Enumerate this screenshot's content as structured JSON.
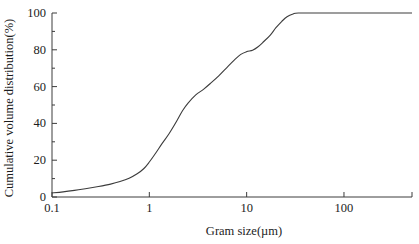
{
  "figure": {
    "background": "#ffffff",
    "curve_color": "#3c3c3c",
    "axis_color": "#3c3c3c",
    "text_color": "#1c1c1c"
  },
  "chart_data": {
    "type": "line",
    "title": "",
    "xlabel": "Gram size(µm)",
    "ylabel": "Cumulative volume distribution(%)",
    "x_scale": "log",
    "x_range": [
      0.1,
      500
    ],
    "y_range": [
      0,
      100
    ],
    "grid": false,
    "legend": "none",
    "x_axis": {
      "tick_labels": [
        "0.1",
        "1",
        "10",
        "100"
      ],
      "tick_values": [
        0.1,
        1,
        10,
        100
      ],
      "end_tick_value": 500
    },
    "y_axis": {
      "major_ticks": [
        0,
        20,
        40,
        60,
        80,
        100
      ],
      "minor_ticks": [
        10,
        30,
        50,
        70,
        90
      ]
    },
    "series": [
      {
        "name": "cumulative-volume-distribution",
        "points": [
          [
            0.1,
            2.2
          ],
          [
            0.13,
            2.8
          ],
          [
            0.17,
            3.6
          ],
          [
            0.22,
            4.5
          ],
          [
            0.3,
            5.7
          ],
          [
            0.4,
            7.0
          ],
          [
            0.5,
            8.4
          ],
          [
            0.62,
            10.2
          ],
          [
            0.75,
            12.6
          ],
          [
            0.88,
            15.5
          ],
          [
            1.0,
            19.0
          ],
          [
            1.15,
            23.5
          ],
          [
            1.35,
            29.0
          ],
          [
            1.6,
            34.5
          ],
          [
            1.9,
            41.0
          ],
          [
            2.2,
            47.0
          ],
          [
            2.5,
            51.0
          ],
          [
            3.0,
            55.5
          ],
          [
            3.6,
            58.5
          ],
          [
            4.3,
            62.0
          ],
          [
            5.2,
            66.0
          ],
          [
            6.3,
            70.5
          ],
          [
            7.5,
            74.5
          ],
          [
            8.7,
            77.5
          ],
          [
            10.0,
            79.0
          ],
          [
            11.5,
            79.8
          ],
          [
            13.0,
            81.5
          ],
          [
            15.0,
            84.5
          ],
          [
            17.5,
            88.0
          ],
          [
            20.0,
            92.0
          ],
          [
            23.0,
            95.5
          ],
          [
            26.0,
            98.0
          ],
          [
            30.0,
            99.5
          ],
          [
            34.0,
            100.0
          ],
          [
            60.0,
            100.0
          ],
          [
            150.0,
            100.0
          ],
          [
            500.0,
            100.0
          ]
        ]
      }
    ]
  }
}
